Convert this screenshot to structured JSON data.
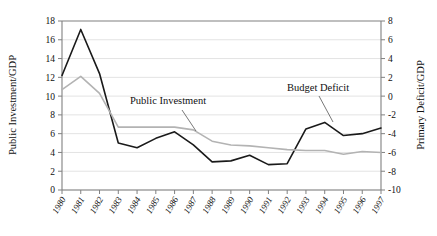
{
  "chart_data": {
    "type": "line",
    "title": "",
    "xlabel": "",
    "ylabel": "Public Investment/GDP",
    "y2label": "Primary Deficit/GDP",
    "grid": true,
    "legend_position": "inline-annotations",
    "categories": [
      "1980",
      "1981",
      "1982",
      "1983",
      "1984",
      "1985",
      "1986",
      "1987",
      "1988",
      "1989",
      "1990",
      "1991",
      "1992",
      "1993",
      "1994",
      "1995",
      "1996",
      "1997"
    ],
    "x": [
      1980,
      1981,
      1982,
      1983,
      1984,
      1985,
      1986,
      1987,
      1988,
      1989,
      1990,
      1991,
      1992,
      1993,
      1994,
      1995,
      1996,
      1997
    ],
    "ylim": [
      0,
      18
    ],
    "yticks": [
      0,
      2,
      4,
      6,
      8,
      10,
      12,
      14,
      16,
      18
    ],
    "ytick_labels": [
      "0",
      "2",
      "4",
      "6",
      "8",
      "10",
      "12",
      "14",
      "16",
      "18"
    ],
    "y2lim": [
      -10,
      8
    ],
    "y2ticks": [
      -10,
      -8,
      -6,
      -4,
      -2,
      0,
      2,
      4,
      6,
      8
    ],
    "y2tick_labels": [
      "-10",
      "-8",
      "-6",
      "-4",
      "-2",
      "0",
      "2",
      "4",
      "6",
      "8"
    ],
    "series": [
      {
        "name": "Budget Deficit",
        "axis": "right",
        "color": "#1a1a1a",
        "width": 1.6,
        "values": [
          2.2,
          7.1,
          2.4,
          -5.0,
          -5.5,
          -4.5,
          -3.8,
          -5.2,
          -7.0,
          -6.9,
          -6.3,
          -7.3,
          -7.2,
          -3.5,
          -2.8,
          -4.2,
          -4.0,
          -3.4
        ]
      },
      {
        "name": "Public Investment",
        "axis": "left",
        "color": "#b3b3b3",
        "width": 1.6,
        "values": [
          10.7,
          12.1,
          10.3,
          6.7,
          6.7,
          6.7,
          6.7,
          6.4,
          5.2,
          4.8,
          4.7,
          4.5,
          4.3,
          4.2,
          4.2,
          3.8,
          4.1,
          4.0
        ]
      }
    ],
    "annotations": [
      {
        "text": "Public Investment",
        "x": 130,
        "y": 104,
        "leader": {
          "x1": 182,
          "y1": 110,
          "x2": 196,
          "y2": 131
        }
      },
      {
        "text": "Budget Deficit",
        "x": 287,
        "y": 91,
        "leader": {
          "x1": 319,
          "y1": 96,
          "x2": 333,
          "y2": 122
        }
      }
    ]
  },
  "colors": {
    "background": "#ffffff",
    "axis": "#808080",
    "grid": "#e3e3e3",
    "text": "#111111",
    "series_black": "#1a1a1a",
    "series_gray": "#b3b3b3"
  }
}
